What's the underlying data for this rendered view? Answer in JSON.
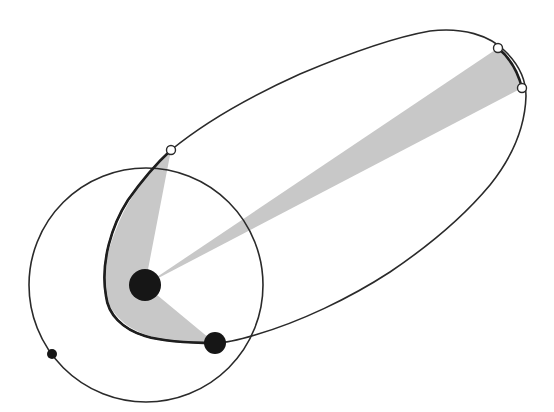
{
  "diagram": {
    "title": "",
    "colors": {
      "background": "#ffffff",
      "stroke": "#2a2a2a",
      "sector_fill": "#c8c8c8",
      "body_fill": "#161616",
      "marker_fill": "#ffffff"
    },
    "bodies": [
      {
        "name": "sun",
        "cx": 145,
        "cy": 285,
        "r": 16
      },
      {
        "name": "planet",
        "cx": 215,
        "cy": 343,
        "r": 11
      },
      {
        "name": "circular-orbit-body",
        "cx": 52,
        "cy": 354,
        "r": 5
      }
    ],
    "circular_orbit": {
      "cx": 146,
      "cy": 285,
      "r": 117
    },
    "position_markers": [
      {
        "name": "marker-near",
        "cx": 171,
        "cy": 150,
        "r": 4.5
      },
      {
        "name": "marker-far-1",
        "cx": 498,
        "cy": 48,
        "r": 4.5
      },
      {
        "name": "marker-far-2",
        "cx": 522,
        "cy": 88,
        "r": 4.5
      }
    ],
    "sectors": [
      {
        "name": "near-sun-sector",
        "label": ""
      },
      {
        "name": "far-sector",
        "label": ""
      }
    ],
    "labels": []
  }
}
